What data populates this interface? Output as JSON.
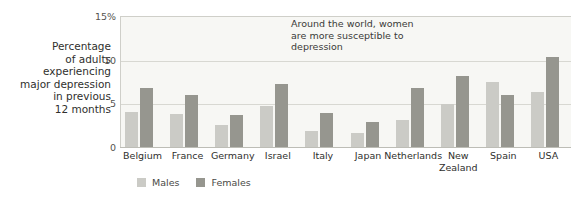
{
  "chart_data": {
    "type": "bar",
    "title": "",
    "xlabel": "",
    "ylabel": "Percentage of adults experiencing major depression in previous 12 months",
    "ylim": [
      0,
      15
    ],
    "yticks": [
      0,
      5,
      10,
      15
    ],
    "ytick_labels": [
      "0",
      "5",
      "10",
      "15%"
    ],
    "grid": true,
    "legend_position": "bottom-left",
    "categories": [
      "Belgium",
      "France",
      "Germany",
      "Israel",
      "Italy",
      "Japan",
      "Netherlands",
      "New\nZealand",
      "Spain",
      "USA"
    ],
    "series": [
      {
        "name": "Males",
        "color": "#cbcbc6",
        "values": [
          4.0,
          3.8,
          2.5,
          4.7,
          1.8,
          1.6,
          3.1,
          4.9,
          7.4,
          6.3
        ]
      },
      {
        "name": "Females",
        "color": "#96968f",
        "values": [
          6.8,
          6.0,
          3.7,
          7.2,
          3.9,
          2.9,
          6.8,
          8.1,
          5.9,
          10.3
        ]
      }
    ],
    "annotations": [
      {
        "text_lines": [
          "Around the world, women",
          "are more susceptible to",
          "depression"
        ]
      }
    ]
  },
  "axis_title_lines": [
    "Percentage",
    "of adults",
    "experiencing",
    "major depression",
    "in previous",
    "12 months"
  ],
  "colors": {
    "plot_background": "#f7f7f4",
    "gridline": "#d8d8d2",
    "axis": "#bdbdb6",
    "male": "#cbcbc6",
    "female": "#96968f",
    "text": "#2f2f2d"
  }
}
